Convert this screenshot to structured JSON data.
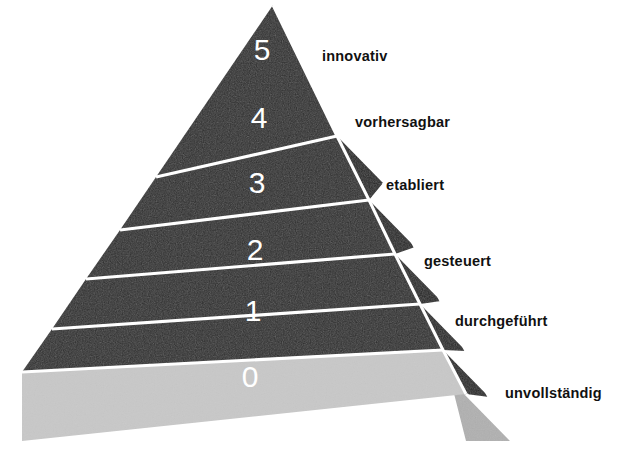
{
  "figure": {
    "type": "pyramid-maturity-model",
    "title": "",
    "background_color": "#ffffff",
    "colors": {
      "level_fill_dark": "#2d2d2d",
      "level_fill_light": "#c8c8c8",
      "side_face_dark": "#232323",
      "side_face_light": "#b4b4b4",
      "divider": "#ffffff",
      "number_text": "#ffffff",
      "label_text": "#111111"
    },
    "geometry": {
      "apex": [
        273,
        5
      ],
      "base_left": [
        22,
        372
      ],
      "base_right_front": [
        466,
        394
      ],
      "base_right_back": [
        512,
        441
      ],
      "depth_x": 46,
      "depth_y": 47
    }
  },
  "levels": [
    {
      "number": "5",
      "label": "innovativ",
      "fill": "dark",
      "num_x": 262,
      "num_y": 52,
      "label_x": 322,
      "label_y": 57
    },
    {
      "number": "4",
      "label": "vorhersagbar",
      "fill": "dark",
      "num_x": 259,
      "num_y": 120,
      "label_x": 355,
      "label_y": 123
    },
    {
      "number": "3",
      "label": "etabliert",
      "fill": "dark",
      "num_x": 257,
      "num_y": 185,
      "label_x": 386,
      "label_y": 186
    },
    {
      "number": "2",
      "label": "gesteuert",
      "fill": "dark",
      "num_x": 255,
      "num_y": 252,
      "label_x": 424,
      "label_y": 262
    },
    {
      "number": "1",
      "label": "durchgeführt",
      "fill": "dark",
      "num_x": 253,
      "num_y": 313,
      "label_x": 455,
      "label_y": 322
    },
    {
      "number": "0",
      "label": "unvollständig",
      "fill": "light",
      "num_x": 250,
      "num_y": 379,
      "label_x": 505,
      "label_y": 394
    }
  ]
}
